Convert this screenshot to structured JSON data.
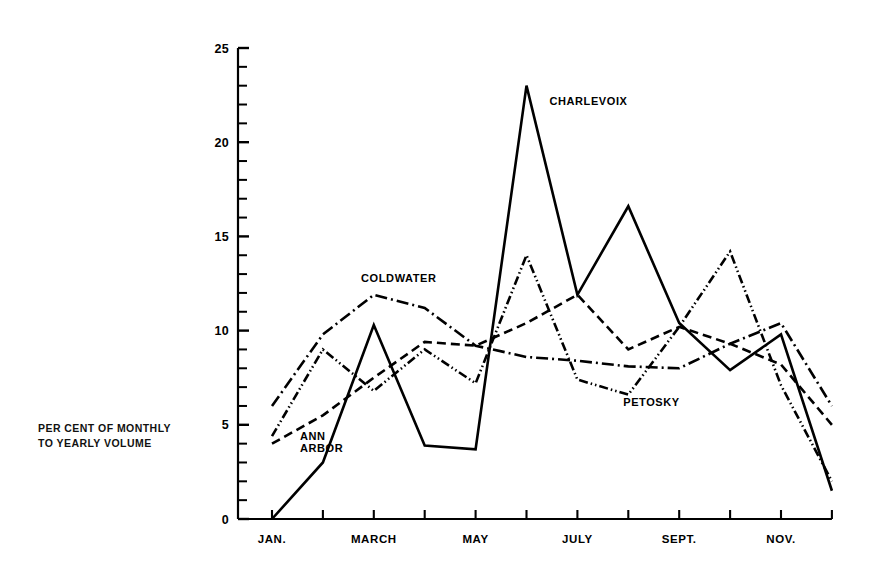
{
  "figure": {
    "background": "#ffffff",
    "ink_color": "#000000"
  },
  "axis_caption": {
    "line1": "PER CENT OF MONTHLY",
    "line2": "TO YEARLY VOLUME"
  },
  "chart_data": {
    "type": "line",
    "title": "",
    "subtitle": "",
    "xlabel": "",
    "ylabel": "PER CENT OF MONTHLY TO YEARLY VOLUME",
    "x": [
      "JAN.",
      "FEB.",
      "MARCH",
      "APRIL",
      "MAY",
      "JUNE",
      "JULY",
      "AUG.",
      "SEPT.",
      "OCT.",
      "NOV.",
      "DEC."
    ],
    "x_tick_labels": [
      "JAN.",
      "",
      "MARCH",
      "",
      "MAY",
      "",
      "JULY",
      "",
      "SEPT.",
      "",
      "NOV.",
      ""
    ],
    "xlim": [
      1,
      12
    ],
    "ylim": [
      0,
      25
    ],
    "y_major_ticks": [
      0,
      5,
      10,
      15,
      20,
      25
    ],
    "y_minor_tick_step": 1,
    "grid": false,
    "legend_position": "inline-annotations",
    "series": [
      {
        "name": "CHARLEVOIX",
        "line_style": "solid",
        "dash_pattern": "none",
        "color": "#000000",
        "values": [
          0.0,
          3.0,
          10.3,
          3.9,
          3.7,
          23.0,
          11.9,
          16.6,
          10.4,
          7.9,
          9.8,
          1.5
        ],
        "annotation": {
          "text": "CHARLEVOIX",
          "x_month": 6.45,
          "y_value": 22.0
        }
      },
      {
        "name": "COLDWATER",
        "line_style": "dash-dot",
        "dash_pattern": "12,4,2,4",
        "color": "#000000",
        "values": [
          6.0,
          9.8,
          11.9,
          11.2,
          9.2,
          8.6,
          8.4,
          8.1,
          8.0,
          9.3,
          10.4,
          6.0
        ],
        "annotation": {
          "text": "COLDWATER",
          "x_month": 2.75,
          "y_value": 12.6
        }
      },
      {
        "name": "ANN ARBOR",
        "line_style": "dashed",
        "dash_pattern": "9,5",
        "color": "#000000",
        "values": [
          4.0,
          5.5,
          7.5,
          9.4,
          9.2,
          10.4,
          11.9,
          9.0,
          10.2,
          9.3,
          8.2,
          5.0
        ],
        "annotation": {
          "text": "ANN\nARBOR",
          "x_month": 1.55,
          "y_value": 4.2
        }
      },
      {
        "name": "PETOSKY",
        "line_style": "dash-dot-dot",
        "dash_pattern": "9,3,1.5,3,1.5,3",
        "color": "#000000",
        "values": [
          4.4,
          9.0,
          6.8,
          9.0,
          7.2,
          14.0,
          7.4,
          6.6,
          10.2,
          14.2,
          7.1,
          2.0
        ],
        "annotation": {
          "text": "PETOSKY",
          "x_month": 7.9,
          "y_value": 6.0
        }
      }
    ]
  },
  "plot_geometry": {
    "axis_x_px": 238,
    "axis_y0_px": 519,
    "axis_y25_px": 48,
    "x_first_tick_px": 272,
    "x_tick_spacing_px": 50.9
  }
}
